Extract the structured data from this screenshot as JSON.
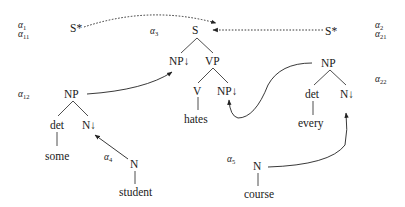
{
  "diagram": {
    "type": "LTAG derivation",
    "labels": {
      "a1": {
        "base": "α",
        "sub": "1"
      },
      "a11": {
        "base": "α",
        "sub": "11"
      },
      "a2": {
        "base": "α",
        "sub": "2"
      },
      "a21": {
        "base": "α",
        "sub": "21"
      },
      "a3": {
        "base": "α",
        "sub": "3"
      },
      "a12": {
        "base": "α",
        "sub": "12"
      },
      "a22": {
        "base": "α",
        "sub": "22"
      },
      "a4": {
        "base": "α",
        "sub": "4"
      },
      "a5": {
        "base": "α",
        "sub": "5"
      }
    },
    "nodes": {
      "s_star_left": "S*",
      "s_star_right": "S*",
      "s_root": "S",
      "np_subst_subj": "NP↓",
      "vp": "VP",
      "v": "V",
      "np_subst_obj": "NP↓",
      "hates": "hates",
      "np_left": "NP",
      "det_left": "det",
      "n_subst_left": "N↓",
      "some": "some",
      "n_student": "N",
      "student": "student",
      "np_right": "NP",
      "det_right": "det",
      "n_subst_right": "N↓",
      "every": "every",
      "n_course": "N",
      "course": "course"
    },
    "arrows": [
      {
        "from": "s_star_left",
        "to": "s_root",
        "style": "dotted",
        "meaning": "adjunction"
      },
      {
        "from": "s_star_right",
        "to": "s_root",
        "style": "dotted",
        "meaning": "adjunction"
      },
      {
        "from": "np_left",
        "to": "np_subst_subj",
        "style": "solid",
        "meaning": "substitution"
      },
      {
        "from": "np_right",
        "to": "np_subst_obj",
        "style": "solid",
        "meaning": "substitution"
      },
      {
        "from": "n_student",
        "to": "n_subst_left",
        "style": "solid",
        "meaning": "substitution"
      },
      {
        "from": "n_course",
        "to": "n_subst_right",
        "style": "solid",
        "meaning": "substitution"
      }
    ]
  }
}
